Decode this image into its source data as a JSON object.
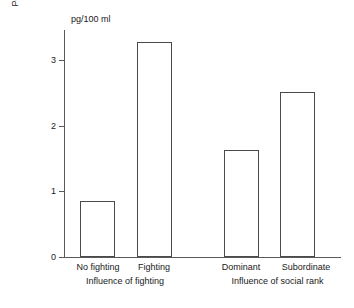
{
  "chart_data": {
    "type": "bar",
    "title": "",
    "subtitle": "",
    "unit_label": "pg/100 ml",
    "xlabel": "",
    "ylabel": "Post-session minus pre-session\nplasma corticosteroid levels",
    "ylim": [
      0,
      3.45
    ],
    "yticks": [
      0,
      1,
      2,
      3
    ],
    "ytick_labels": [
      "0",
      "1",
      "2",
      "3"
    ],
    "grid": false,
    "legend": "none",
    "categories": [
      "No fighting",
      "Fighting",
      "Dominant",
      "Subordinate"
    ],
    "values": [
      0.85,
      3.27,
      1.63,
      2.51
    ],
    "groups": [
      {
        "label": "Influence of fighting",
        "categories": [
          "No fighting",
          "Fighting"
        ]
      },
      {
        "label": "Influence of social rank",
        "categories": [
          "Dominant",
          "Subordinate"
        ]
      }
    ],
    "bar_style": {
      "fill": "#ffffff",
      "edge": "#4a4a4a"
    },
    "axis_color": "#5a5a5a"
  },
  "axis": {
    "tick_0": "0",
    "tick_1": "1",
    "tick_2": "2",
    "tick_3": "3"
  },
  "labels": {
    "unit": "pg/100 ml",
    "y_title": "Post-session minus pre-session\nplasma corticosteroid levels",
    "cat_0": "No fighting",
    "cat_1": "Fighting",
    "cat_2": "Dominant",
    "cat_3": "Subordinate",
    "group_0": "Influence of fighting",
    "group_1": "Influence of social rank"
  }
}
